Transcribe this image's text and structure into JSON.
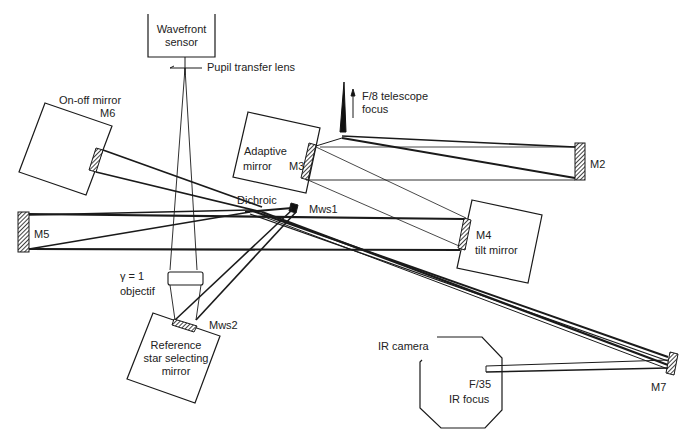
{
  "diagram": {
    "type": "optical-layout",
    "colors": {
      "ink": "#1a1a1a",
      "background": "#ffffff"
    },
    "labels": {
      "wavefront_sensor_line1": "Wavefront",
      "wavefront_sensor_line2": "sensor",
      "pupil_transfer_lens": "Pupil transfer lens",
      "on_off_mirror": "On-off mirror",
      "m6": "M6",
      "f8_line1": "F/8 telescope",
      "f8_line2": "focus",
      "adaptive_line1": "Adaptive",
      "adaptive_line2": "mirror",
      "m3": "M3",
      "m2": "M2",
      "dichroic": "Dichroic",
      "mws1": "Mws1",
      "m5": "M5",
      "m4": "M4",
      "tilt_mirror": "tilt mirror",
      "gamma": "γ = 1",
      "objectif": "objectif",
      "mws2": "Mws2",
      "ref_line1": "Reference",
      "ref_line2": "star selecting",
      "ref_line3": "mirror",
      "ir_camera": "IR camera",
      "f35": "F/35",
      "ir_focus": "IR focus",
      "m7": "M7"
    },
    "components": [
      "Wavefront sensor",
      "Pupil transfer lens",
      "On-off mirror M6",
      "F/8 telescope focus",
      "Adaptive mirror M3",
      "M2",
      "Dichroic",
      "Mws1",
      "M5",
      "M4 tilt mirror",
      "γ = 1 objectif",
      "Mws2",
      "Reference star selecting mirror",
      "IR camera",
      "F/35 IR focus",
      "M7"
    ]
  }
}
